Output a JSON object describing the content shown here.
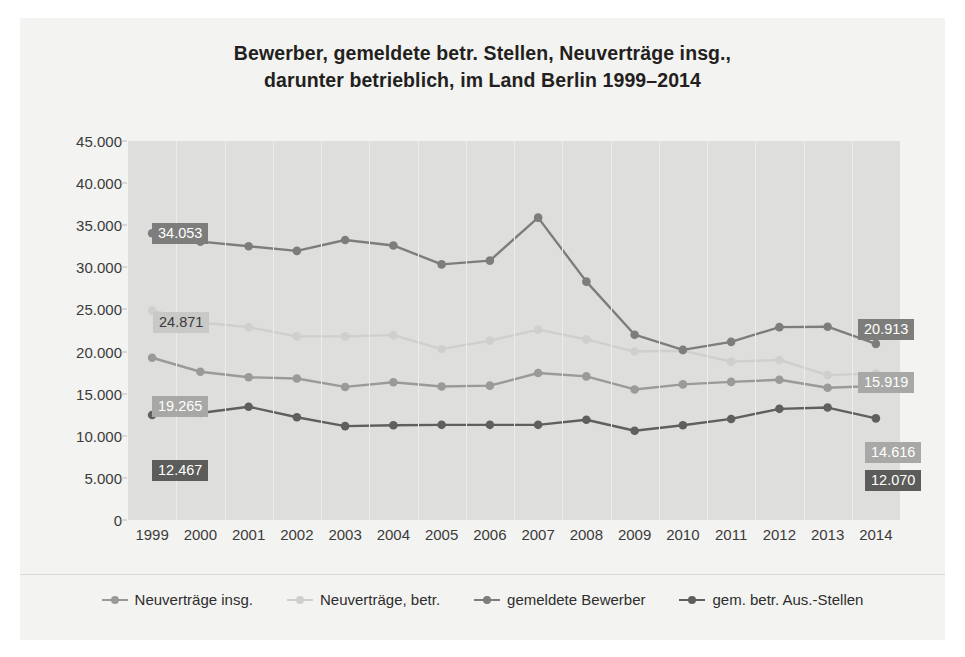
{
  "title": {
    "line1": "Bewerber, gemeldete betr. Stellen, Neuverträge insg.,",
    "line2": "darunter betrieblich, im Land Berlin 1999–2014"
  },
  "chart_data": {
    "type": "line",
    "title": "Bewerber, gemeldete betr. Stellen, Neuverträge insg., darunter betrieblich, im Land Berlin 1999–2014",
    "xlabel": "",
    "ylabel": "",
    "x": [
      "1999",
      "2000",
      "2001",
      "2002",
      "2003",
      "2004",
      "2005",
      "2006",
      "2007",
      "2008",
      "2009",
      "2010",
      "2011",
      "2012",
      "2013",
      "2014"
    ],
    "ylim": [
      0,
      45000
    ],
    "yticks": [
      0,
      5000,
      10000,
      15000,
      20000,
      25000,
      30000,
      35000,
      40000,
      45000
    ],
    "ytick_labels": [
      "0",
      "5.000",
      "10.000",
      "15.000",
      "20.000",
      "25.000",
      "30.000",
      "35.000",
      "40.000",
      "45.000"
    ],
    "grid": "vertical",
    "legend_position": "bottom",
    "series": [
      {
        "name": "Neuverträge insg.",
        "color": "#9a9a98",
        "values": [
          19265,
          17600,
          16950,
          16800,
          15800,
          16350,
          15850,
          15950,
          17450,
          17050,
          15500,
          16100,
          16400,
          16650,
          15700,
          15919
        ]
      },
      {
        "name": "Neuverträge, betr.",
        "color": "#cfcfcd",
        "values": [
          24871,
          23450,
          22900,
          21800,
          21800,
          21950,
          20300,
          21300,
          22600,
          21450,
          20000,
          20100,
          18800,
          19000,
          17200,
          17400
        ]
      },
      {
        "name": "gemeldete Bewerber",
        "color": "#7d7d7b",
        "values": [
          34053,
          33050,
          32500,
          31950,
          33250,
          32600,
          30350,
          30800,
          35900,
          28300,
          22000,
          20200,
          21150,
          22900,
          22950,
          20913
        ]
      },
      {
        "name": "gem. betr. Aus.-Stellen",
        "color": "#5f5f5d",
        "values": [
          12467,
          12700,
          13450,
          12200,
          11150,
          11250,
          11300,
          11300,
          11300,
          11900,
          10600,
          11250,
          12000,
          13200,
          13350,
          12070
        ]
      }
    ],
    "callouts": [
      {
        "id": "left-bewerber",
        "text": "34.053",
        "style": "dark",
        "x": 132,
        "y": 205
      },
      {
        "id": "left-neu-betr",
        "text": "24.871",
        "style": "light",
        "x": 133,
        "y": 294
      },
      {
        "id": "left-neu-insg",
        "text": "19.265",
        "style": "mid",
        "x": 132,
        "y": 378
      },
      {
        "id": "left-aus-stellen",
        "text": "12.467",
        "style": "darker",
        "x": 132,
        "y": 442
      },
      {
        "id": "right-bewerber",
        "text": "20.913",
        "style": "dark",
        "x": 838,
        "y": 301
      },
      {
        "id": "right-neu-insg",
        "text": "15.919",
        "style": "mid",
        "x": 838,
        "y": 354
      },
      {
        "id": "right-neu-betr",
        "text": "14.616",
        "style": "mid",
        "x": 845,
        "y": 424
      },
      {
        "id": "right-aus-stellen",
        "text": "12.070",
        "style": "darker",
        "x": 845,
        "y": 452
      }
    ]
  },
  "legend": {
    "items": [
      {
        "label": "Neuverträge insg.",
        "color": "#9a9a98"
      },
      {
        "label": "Neuverträge, betr.",
        "color": "#cfcfcd"
      },
      {
        "label": "gemeldete Bewerber",
        "color": "#7d7d7b"
      },
      {
        "label": "gem. betr. Aus.-Stellen",
        "color": "#5f5f5d"
      }
    ]
  }
}
